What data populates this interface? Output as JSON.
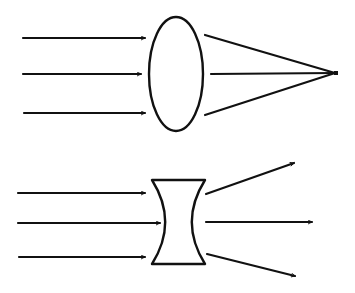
{
  "diagram": {
    "title": "",
    "stroke_color": "#111111",
    "background": "#ffffff",
    "converging": {
      "lens": {
        "type": "convex",
        "cx": 176,
        "cy": 74,
        "rx": 27,
        "ry": 57
      },
      "incoming_rays": [
        {
          "x1": 23,
          "y1": 38,
          "x2": 145,
          "y2": 38
        },
        {
          "x1": 23,
          "y1": 74,
          "x2": 141,
          "y2": 74
        },
        {
          "x1": 24,
          "y1": 113,
          "x2": 145,
          "y2": 113
        }
      ],
      "outgoing_rays": [
        {
          "x1": 205,
          "y1": 35,
          "x2": 335,
          "y2": 73
        },
        {
          "x1": 211,
          "y1": 74,
          "x2": 335,
          "y2": 73
        },
        {
          "x1": 205,
          "y1": 115,
          "x2": 335,
          "y2": 73
        }
      ],
      "focal_point": {
        "x": 336,
        "y": 73
      }
    },
    "diverging": {
      "lens": {
        "type": "concave",
        "top": 180,
        "bottom": 264,
        "left": 152,
        "right": 205
      },
      "incoming_rays": [
        {
          "x1": 18,
          "y1": 193,
          "x2": 145,
          "y2": 193
        },
        {
          "x1": 18,
          "y1": 223,
          "x2": 160,
          "y2": 223
        },
        {
          "x1": 19,
          "y1": 257,
          "x2": 145,
          "y2": 257
        }
      ],
      "outgoing_rays": [
        {
          "x1": 206,
          "y1": 194,
          "x2": 294,
          "y2": 163
        },
        {
          "x1": 206,
          "y1": 222,
          "x2": 312,
          "y2": 222
        },
        {
          "x1": 207,
          "y1": 254,
          "x2": 295,
          "y2": 276
        }
      ]
    }
  }
}
